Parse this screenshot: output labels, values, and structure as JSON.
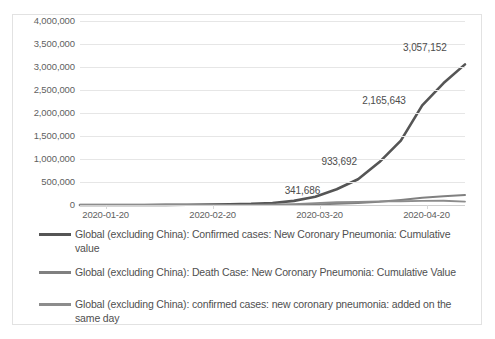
{
  "chart_data": {
    "type": "line",
    "title": "",
    "xlabel": "",
    "ylabel": "",
    "ylim": [
      0,
      4000000
    ],
    "grid": true,
    "legend_position": "bottom",
    "y_ticks": [
      "4,000,000",
      "3,500,000",
      "3,000,000",
      "2,500,000",
      "2,000,000",
      "1,500,000",
      "1,000,000",
      "500,000",
      "0"
    ],
    "y_tick_values": [
      4000000,
      3500000,
      3000000,
      2500000,
      2000000,
      1500000,
      1000000,
      500000,
      0
    ],
    "x_ticks": [
      "2020-01-20",
      "2020-02-20",
      "2020-03-20",
      "2020-04-20"
    ],
    "annotations": [
      {
        "text": "3,057,152",
        "value": 3057152
      },
      {
        "text": "2,165,643",
        "value": 2165643
      },
      {
        "text": "933,692",
        "value": 933692
      },
      {
        "text": "341,686",
        "value": 341686
      }
    ],
    "series": [
      {
        "name": "Global (excluding China): Confirmed cases: New Coronary Pneumonia: Cumulative value",
        "color": "#555555",
        "values": [
          0,
          0,
          0,
          1000,
          3000,
          6000,
          10000,
          16000,
          25000,
          45000,
          90000,
          180000,
          341686,
          560000,
          933692,
          1400000,
          2165643,
          2650000,
          3057152
        ]
      },
      {
        "name": "Global (excluding China): Death Case: New Coronary Pneumonia: Cumulative Value",
        "color": "#808080",
        "values": [
          0,
          0,
          0,
          0,
          0,
          0,
          500,
          1000,
          2000,
          3500,
          6000,
          12000,
          25000,
          45000,
          70000,
          110000,
          160000,
          190000,
          215000
        ]
      },
      {
        "name": "Global (excluding China): confirmed cases: new coronary pneumonia: added on the same day",
        "color": "#8c8c8c",
        "values": [
          0,
          0,
          0,
          200,
          500,
          900,
          1500,
          2500,
          4000,
          8000,
          20000,
          40000,
          60000,
          70000,
          78000,
          82000,
          88000,
          92000,
          75000
        ]
      }
    ]
  },
  "legend": {
    "items": [
      {
        "label": "Global (excluding China): Confirmed cases: New Coronary Pneumonia: Cumulative value"
      },
      {
        "label": "Global (excluding China): Death Case: New Coronary Pneumonia: Cumulative Value"
      },
      {
        "label": "Global (excluding China): confirmed cases: new coronary pneumonia: added on the same day"
      }
    ]
  }
}
